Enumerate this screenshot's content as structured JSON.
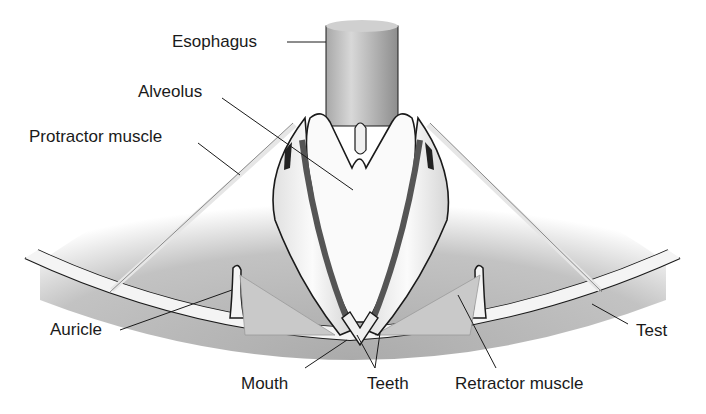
{
  "diagram": {
    "colors": {
      "background": "#ffffff",
      "fill_gray": "#b5b5b5",
      "dark_gray": "#7a7a7a",
      "light": "#f2f2f2",
      "line": "#1a1a1a"
    },
    "labels": {
      "esophagus": "Esophagus",
      "alveolus": "Alveolus",
      "protractor_muscle": "Protractor muscle",
      "auricle": "Auricle",
      "mouth": "Mouth",
      "teeth": "Teeth",
      "retractor_muscle": "Retractor muscle",
      "test": "Test"
    }
  }
}
